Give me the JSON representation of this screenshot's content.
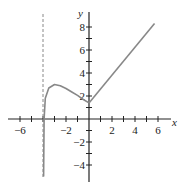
{
  "chart_data": {
    "type": "line",
    "title": "",
    "xlabel": "x",
    "ylabel": "y",
    "xlim": [
      -7,
      7.5
    ],
    "ylim": [
      -5,
      9.5
    ],
    "grid": false,
    "x_ticks": [
      -6,
      -5,
      -4,
      -3,
      -2,
      -1,
      1,
      2,
      3,
      4,
      5,
      6
    ],
    "x_tick_labels": [
      "-6",
      "-2",
      "2",
      "4",
      "6"
    ],
    "x_tick_label_values": [
      -6,
      -2,
      2,
      4,
      6
    ],
    "y_ticks": [
      -4,
      -3,
      -2,
      -1,
      1,
      2,
      3,
      4,
      5,
      6,
      7,
      8
    ],
    "y_tick_labels": [
      "8",
      "6",
      "4",
      "2",
      "-2",
      "-4"
    ],
    "y_tick_label_values": [
      8,
      6,
      4,
      2,
      -2,
      -4
    ],
    "asymptote": {
      "type": "vertical",
      "x": -4,
      "style": "dashed"
    },
    "series": [
      {
        "name": "left branch",
        "points": [
          [
            -3.95,
            -5
          ],
          [
            -3.9,
            0
          ],
          [
            -3.8,
            1.8
          ],
          [
            -3.5,
            2.7
          ],
          [
            -3,
            3.0
          ],
          [
            -2.5,
            2.9
          ],
          [
            -2,
            2.65
          ],
          [
            -1.5,
            2.35
          ],
          [
            -1,
            2.05
          ],
          [
            -0.5,
            1.7
          ],
          [
            0,
            1.4
          ]
        ]
      },
      {
        "name": "right branch",
        "points": [
          [
            0,
            1.4
          ],
          [
            5.7,
            8.3
          ]
        ]
      }
    ],
    "colors": {
      "curve": "#888888",
      "axis": "#222222",
      "asymptote": "#888888"
    }
  }
}
